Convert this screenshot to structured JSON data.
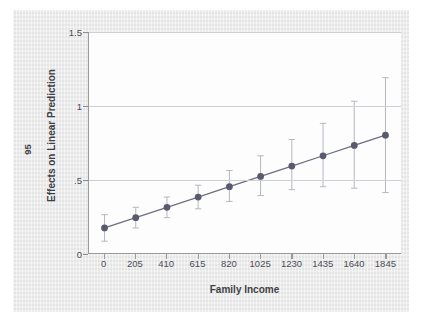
{
  "chart_data": {
    "type": "line",
    "title": "",
    "xlabel": "Family Income",
    "ylabel": "Effects on Linear Prediction",
    "ci_label": "95",
    "x": [
      0,
      205,
      410,
      615,
      820,
      1025,
      1230,
      1435,
      1640,
      1845
    ],
    "xtick_labels": [
      "0",
      "205",
      "410",
      "615",
      "820",
      "1025",
      "1230",
      "1435",
      "1640",
      "1845"
    ],
    "ytick_values": [
      0,
      0.5,
      1,
      1.5
    ],
    "ytick_labels": [
      "0",
      ".5",
      "1",
      "1.5"
    ],
    "xlim": [
      -102,
      1947
    ],
    "ylim": [
      0,
      1.5
    ],
    "grid": "horizontal",
    "legend": "none",
    "series": [
      {
        "name": "Effects on Linear Prediction",
        "values": [
          0.17,
          0.24,
          0.31,
          0.38,
          0.45,
          0.52,
          0.59,
          0.66,
          0.73,
          0.8
        ],
        "ci_lower": [
          0.08,
          0.17,
          0.24,
          0.3,
          0.35,
          0.39,
          0.43,
          0.45,
          0.44,
          0.41
        ],
        "ci_upper": [
          0.26,
          0.31,
          0.38,
          0.46,
          0.56,
          0.66,
          0.77,
          0.88,
          1.03,
          1.19
        ],
        "marker": "circle",
        "color": "#5a5a6e",
        "line_color": "#6e6e80"
      }
    ]
  },
  "style": {
    "panel_background": "#fdfdfd",
    "figure_background": "#e9e9e9",
    "gridline_color": "#cfcfd6",
    "axis_color": "#9a9a9a",
    "text_color": "#4d4d55"
  }
}
